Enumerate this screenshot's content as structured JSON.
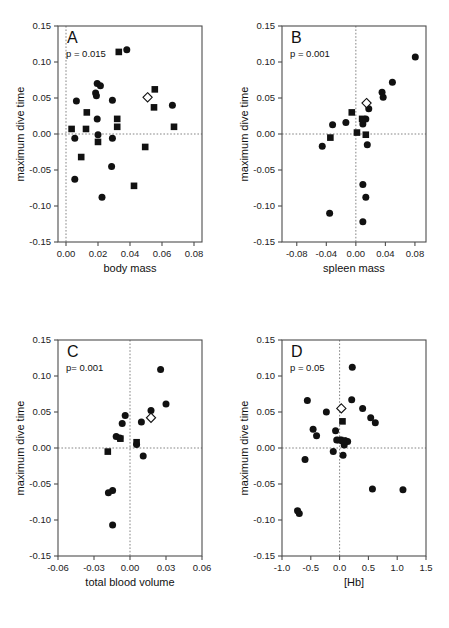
{
  "figure": {
    "title": "",
    "panel_count": 4,
    "shared_ylabel": "maximum dive time",
    "marker_legend": {
      "filled_circle": "filled-circle",
      "filled_square": "filled-square",
      "open_diamond": "open-diamond"
    },
    "colors": {
      "marker_fill": "#111111",
      "open_marker_stroke": "#111111",
      "open_marker_fill": "#ffffff",
      "axis": "#4d4d4d",
      "reference_line": "#777777",
      "background": "#ffffff"
    }
  },
  "chart_data": [
    {
      "type": "scatter",
      "panel": "A",
      "title": "A",
      "annotation": "p = 0.015",
      "xlabel": "body mass",
      "ylabel": "maximum dive time",
      "xlim": [
        -0.005,
        0.085
      ],
      "ylim": [
        -0.15,
        0.15
      ],
      "xticks": [
        0.0,
        0.02,
        0.04,
        0.06,
        0.08
      ],
      "xticklabels": [
        "0.00",
        "0.02",
        "0.04",
        "0.06",
        "0.08"
      ],
      "yticks": [
        -0.15,
        -0.1,
        -0.05,
        0.0,
        0.05,
        0.1,
        0.15
      ],
      "yticklabels": [
        "-0.15",
        "-0.10",
        "-0.05",
        "0.00",
        "0.05",
        "0.10",
        "0.15"
      ],
      "grid": false,
      "reference_lines": {
        "x": 0.0,
        "y": 0.0
      },
      "legend": "none",
      "series": [
        {
          "name": "filled-circle",
          "marker": "circle",
          "points": [
            [
              0.0055,
              -0.006
            ],
            [
              0.0065,
              0.046
            ],
            [
              0.0055,
              -0.063
            ],
            [
              0.0195,
              0.07
            ],
            [
              0.0185,
              0.057
            ],
            [
              0.019,
              0.053
            ],
            [
              0.0215,
              0.067
            ],
            [
              0.0195,
              0.021
            ],
            [
              0.02,
              -0.001
            ],
            [
              0.0225,
              -0.088
            ],
            [
              0.029,
              0.047
            ],
            [
              0.029,
              -0.006
            ],
            [
              0.0285,
              -0.045
            ],
            [
              0.038,
              0.117
            ],
            [
              0.0665,
              0.04
            ]
          ]
        },
        {
          "name": "filled-square",
          "marker": "square",
          "points": [
            [
              0.0035,
              0.007
            ],
            [
              0.013,
              0.03
            ],
            [
              0.0125,
              0.007
            ],
            [
              0.033,
              0.114
            ],
            [
              0.032,
              0.021
            ],
            [
              0.032,
              0.01
            ],
            [
              0.02,
              -0.011
            ],
            [
              0.0095,
              -0.032
            ],
            [
              0.0425,
              -0.072
            ],
            [
              0.0495,
              -0.018
            ],
            [
              0.0555,
              0.062
            ],
            [
              0.055,
              0.037
            ],
            [
              0.0675,
              0.01
            ]
          ]
        },
        {
          "name": "open-diamond",
          "marker": "diamond",
          "points": [
            [
              0.051,
              0.051
            ]
          ]
        }
      ]
    },
    {
      "type": "scatter",
      "panel": "B",
      "title": "B",
      "annotation": "p = 0.001",
      "xlabel": "spleen mass",
      "ylabel": "maximum dive time",
      "xlim": [
        -0.1,
        0.095
      ],
      "ylim": [
        -0.15,
        0.15
      ],
      "xticks": [
        -0.08,
        -0.04,
        0.0,
        0.04,
        0.08
      ],
      "xticklabels": [
        "-0.08",
        "-0.04",
        "0.00",
        "0.04",
        "0.08"
      ],
      "yticks": [
        -0.15,
        -0.1,
        -0.05,
        0.0,
        0.05,
        0.1,
        0.15
      ],
      "yticklabels": [
        "-0.15",
        "-0.10",
        "-0.05",
        "0.00",
        "0.05",
        "0.10",
        "0.15"
      ],
      "grid": false,
      "reference_lines": {
        "x": 0.0,
        "y": 0.0
      },
      "legend": "none",
      "series": [
        {
          "name": "filled-circle",
          "marker": "circle",
          "points": [
            [
              -0.0455,
              -0.017
            ],
            [
              -0.0315,
              0.013
            ],
            [
              -0.0135,
              0.016
            ],
            [
              0.0095,
              0.014
            ],
            [
              0.0135,
              0.021
            ],
            [
              0.0175,
              0.035
            ],
            [
              0.0155,
              -0.015
            ],
            [
              0.0355,
              0.058
            ],
            [
              0.037,
              0.051
            ],
            [
              0.0495,
              0.072
            ],
            [
              0.0805,
              0.107
            ],
            [
              0.0095,
              -0.07
            ],
            [
              0.0135,
              -0.088
            ],
            [
              0.0095,
              -0.122
            ],
            [
              -0.0355,
              -0.11
            ]
          ]
        },
        {
          "name": "filled-square",
          "marker": "square",
          "points": [
            [
              -0.0055,
              0.03
            ],
            [
              0.0085,
              0.021
            ],
            [
              0.0015,
              0.002
            ],
            [
              0.0135,
              -0.001
            ],
            [
              -0.0345,
              -0.005
            ]
          ]
        },
        {
          "name": "open-diamond",
          "marker": "diamond",
          "points": [
            [
              0.0145,
              0.043
            ]
          ]
        }
      ]
    },
    {
      "type": "scatter",
      "panel": "C",
      "title": "C",
      "annotation": "p= 0.001",
      "xlabel": "total blood volume",
      "ylabel": "maximum dive time",
      "xlim": [
        -0.06,
        0.06
      ],
      "ylim": [
        -0.15,
        0.15
      ],
      "xticks": [
        -0.06,
        -0.03,
        0.0,
        0.03,
        0.06
      ],
      "xticklabels": [
        "-0.06",
        "-0.03",
        "0.00",
        "0.03",
        "0.06"
      ],
      "yticks": [
        -0.15,
        -0.1,
        -0.05,
        0.0,
        0.05,
        0.1,
        0.15
      ],
      "yticklabels": [
        "-0.15",
        "-0.10",
        "-0.05",
        "0.00",
        "0.05",
        "0.10",
        "0.15"
      ],
      "grid": false,
      "reference_lines": {
        "x": 0.0,
        "y": 0.0
      },
      "legend": "none",
      "series": [
        {
          "name": "filled-circle",
          "marker": "circle",
          "points": [
            [
              -0.0115,
              0.016
            ],
            [
              -0.0085,
              0.014
            ],
            [
              -0.0065,
              0.034
            ],
            [
              -0.004,
              0.045
            ],
            [
              0.0055,
              0.005
            ],
            [
              0.0095,
              0.036
            ],
            [
              0.0175,
              0.052
            ],
            [
              0.0255,
              0.109
            ],
            [
              0.03,
              0.061
            ],
            [
              0.011,
              -0.011
            ],
            [
              -0.018,
              -0.062
            ],
            [
              -0.0145,
              -0.059
            ],
            [
              -0.0145,
              -0.107
            ]
          ]
        },
        {
          "name": "filled-square",
          "marker": "square",
          "points": [
            [
              -0.008,
              0.013
            ],
            [
              0.0055,
              0.008
            ],
            [
              -0.0185,
              -0.005
            ]
          ]
        },
        {
          "name": "open-diamond",
          "marker": "diamond",
          "points": [
            [
              0.0175,
              0.042
            ]
          ]
        }
      ]
    },
    {
      "type": "scatter",
      "panel": "D",
      "title": "D",
      "annotation": "p = 0.05",
      "xlabel": "[Hb]",
      "ylabel": "maximum dive time",
      "xlim": [
        -1.0,
        1.5
      ],
      "ylim": [
        -0.15,
        0.15
      ],
      "xticks": [
        -1.0,
        -0.5,
        0.0,
        0.5,
        1.0,
        1.5
      ],
      "xticklabels": [
        "-1.0",
        "-0.5",
        "0.0",
        "0.5",
        "1.0",
        "1.5"
      ],
      "yticks": [
        -0.15,
        -0.1,
        -0.05,
        0.0,
        0.05,
        0.1,
        0.15
      ],
      "yticklabels": [
        "-0.15",
        "-0.10",
        "-0.05",
        "0.00",
        "0.05",
        "0.10",
        "0.15"
      ],
      "grid": false,
      "reference_lines": {
        "x": 0.0,
        "y": 0.0
      },
      "legend": "none",
      "series": [
        {
          "name": "filled-circle",
          "marker": "circle",
          "points": [
            [
              -0.56,
              0.066
            ],
            [
              -0.23,
              0.05
            ],
            [
              -0.46,
              0.026
            ],
            [
              -0.4,
              0.017
            ],
            [
              -0.07,
              0.024
            ],
            [
              -0.05,
              0.011
            ],
            [
              0.02,
              0.011
            ],
            [
              0.1,
              0.01
            ],
            [
              0.14,
              0.009
            ],
            [
              0.08,
              0.004
            ],
            [
              -0.11,
              -0.005
            ],
            [
              0.06,
              -0.01
            ],
            [
              -0.6,
              -0.016
            ],
            [
              0.22,
              0.112
            ],
            [
              0.21,
              0.067
            ],
            [
              0.4,
              0.055
            ],
            [
              0.54,
              0.042
            ],
            [
              0.62,
              0.035
            ],
            [
              0.57,
              -0.057
            ],
            [
              1.1,
              -0.058
            ],
            [
              -0.73,
              -0.087
            ],
            [
              -0.7,
              -0.091
            ]
          ]
        },
        {
          "name": "filled-square",
          "marker": "square",
          "points": [
            [
              0.05,
              0.037
            ],
            [
              0.01,
              0.011
            ],
            [
              0.06,
              0.01
            ]
          ]
        },
        {
          "name": "open-diamond",
          "marker": "diamond",
          "points": [
            [
              0.03,
              0.055
            ]
          ]
        }
      ]
    }
  ]
}
